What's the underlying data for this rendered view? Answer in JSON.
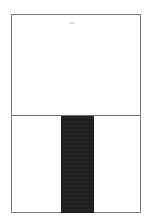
{
  "page": {
    "header_text": "",
    "top_panel": {
      "mark_text": ""
    },
    "bottom_panel": {
      "bar_color": "#1f1f1f"
    }
  },
  "colors": {
    "background": "#ffffff",
    "frame_border": "#7a7a7a",
    "divider": "#6e6e6e",
    "dark_bar": "#1f1f1f"
  }
}
